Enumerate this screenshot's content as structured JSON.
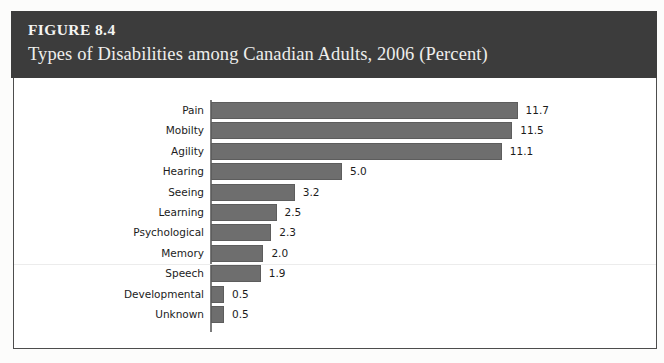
{
  "header": {
    "figure_number": "FIGURE 8.4",
    "title": "Types of Disabilities among Canadian Adults, 2006 (Percent)",
    "background_color": "#3c3c3c",
    "text_color": "#f2f2f0"
  },
  "chart_data": {
    "type": "bar",
    "orientation": "horizontal",
    "title": "Types of Disabilities among Canadian Adults, 2006 (Percent)",
    "xlabel": "",
    "ylabel": "",
    "xlim": [
      0,
      11.7
    ],
    "grid": false,
    "legend": null,
    "bar_color": "#6e6e6e",
    "axis_color": "#7b7b7b",
    "value_label_format": "one-decimal",
    "categories": [
      "Pain",
      "Mobilty",
      "Agility",
      "Hearing",
      "Seeing",
      "Learning",
      "Psychological",
      "Memory",
      "Speech",
      "Developmental",
      "Unknown"
    ],
    "values": [
      11.7,
      11.5,
      11.1,
      5.0,
      3.2,
      2.5,
      2.3,
      2.0,
      1.9,
      0.5,
      0.5
    ],
    "value_labels": [
      "11.7",
      "11.5",
      "11.1",
      "5.0",
      "3.2",
      "2.5",
      "2.3",
      "2.0",
      "1.9",
      "0.5",
      "0.5"
    ]
  }
}
